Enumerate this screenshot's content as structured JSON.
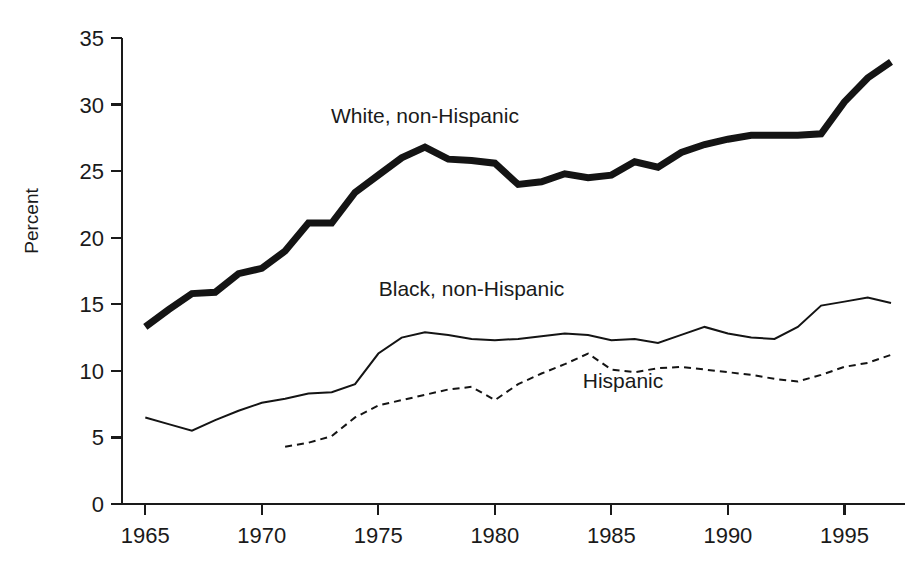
{
  "chart_data": {
    "type": "line",
    "title": "",
    "xlabel": "",
    "ylabel": "Percent",
    "xlim": [
      1964,
      1997.6
    ],
    "ylim": [
      0,
      35
    ],
    "grid": false,
    "legend_position": "inline-annotations",
    "xticks": [
      1965,
      1970,
      1975,
      1980,
      1985,
      1990,
      1995
    ],
    "xtick_labels": [
      "1965",
      "1970",
      "1975",
      "1980",
      "1985",
      "1990",
      "1995"
    ],
    "yticks": [
      0,
      5,
      10,
      15,
      20,
      25,
      30,
      35
    ],
    "ytick_labels": [
      "0",
      "5",
      "10",
      "15",
      "20",
      "25",
      "30",
      "35"
    ],
    "series": [
      {
        "name": "White, non-Hispanic",
        "label": "White, non-Hispanic",
        "style": "thick-solid",
        "stroke_width": 7,
        "dash": "none",
        "color": "#141414",
        "label_x": 1977.0,
        "label_y": 28.6,
        "x": [
          1965,
          1966,
          1967,
          1968,
          1969,
          1970,
          1971,
          1972,
          1973,
          1974,
          1975,
          1976,
          1977,
          1978,
          1979,
          1980,
          1981,
          1982,
          1983,
          1984,
          1985,
          1986,
          1987,
          1988,
          1989,
          1990,
          1991,
          1992,
          1993,
          1994,
          1995,
          1996,
          1997
        ],
        "y": [
          13.3,
          14.6,
          15.8,
          15.9,
          17.3,
          17.7,
          19.0,
          21.1,
          21.1,
          23.4,
          24.7,
          26.0,
          26.8,
          25.9,
          25.8,
          25.6,
          24.0,
          24.2,
          24.8,
          24.5,
          24.7,
          25.7,
          25.3,
          26.4,
          27.0,
          27.4,
          27.7,
          27.7,
          27.7,
          27.8,
          30.2,
          32.0,
          33.2
        ]
      },
      {
        "name": "Black, non-Hispanic",
        "label": "Black, non-Hispanic",
        "style": "thin-solid",
        "stroke_width": 2,
        "dash": "none",
        "color": "#141414",
        "label_x": 1979.0,
        "label_y": 15.6,
        "x": [
          1965,
          1966,
          1967,
          1968,
          1969,
          1970,
          1971,
          1972,
          1973,
          1974,
          1975,
          1976,
          1977,
          1978,
          1979,
          1980,
          1981,
          1982,
          1983,
          1984,
          1985,
          1986,
          1987,
          1988,
          1989,
          1990,
          1991,
          1992,
          1993,
          1994,
          1995,
          1996,
          1997
        ],
        "y": [
          6.5,
          6.0,
          5.5,
          6.3,
          7.0,
          7.6,
          7.9,
          8.3,
          8.4,
          9.0,
          11.3,
          12.5,
          12.9,
          12.7,
          12.4,
          12.3,
          12.4,
          12.6,
          12.8,
          12.7,
          12.3,
          12.4,
          12.1,
          12.7,
          13.3,
          12.8,
          12.5,
          12.4,
          13.3,
          14.9,
          15.2,
          15.5,
          15.1
        ]
      },
      {
        "name": "Hispanic",
        "label": "Hispanic",
        "style": "dashed",
        "stroke_width": 2,
        "dash": "7,5",
        "color": "#141414",
        "label_x": 1985.5,
        "label_y": 8.7,
        "x": [
          1971,
          1972,
          1973,
          1974,
          1975,
          1976,
          1977,
          1978,
          1979,
          1980,
          1981,
          1982,
          1983,
          1984,
          1985,
          1986,
          1987,
          1988,
          1989,
          1990,
          1991,
          1992,
          1993,
          1994,
          1995,
          1996,
          1997
        ],
        "y": [
          4.3,
          4.6,
          5.1,
          6.5,
          7.4,
          7.8,
          8.2,
          8.6,
          8.8,
          7.8,
          9.0,
          9.8,
          10.5,
          11.3,
          10.1,
          9.9,
          10.2,
          10.3,
          10.1,
          9.9,
          9.7,
          9.4,
          9.2,
          9.7,
          10.3,
          10.6,
          11.2
        ]
      }
    ]
  }
}
